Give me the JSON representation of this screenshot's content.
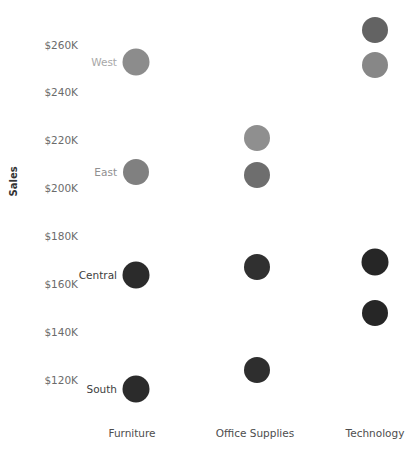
{
  "chart_data": {
    "type": "scatter",
    "title": "",
    "xlabel": "",
    "ylabel": "Sales",
    "categories": [
      "Furniture",
      "Office Supplies",
      "Technology"
    ],
    "y_ticks": [
      "$120K",
      "$140K",
      "$160K",
      "$180K",
      "$200K",
      "$220K",
      "$240K",
      "$260K"
    ],
    "y_tick_values": [
      120000,
      140000,
      160000,
      180000,
      200000,
      220000,
      240000,
      260000
    ],
    "ylim": [
      110000,
      272000
    ],
    "grid": false,
    "legend": "none",
    "series": [
      {
        "name": "West",
        "label": "West",
        "label_color": "#a8a8a8",
        "points": [
          {
            "category": "Furniture",
            "value": 252000,
            "color": "#8c8c8c",
            "size": 27
          },
          {
            "category": "Office Supplies",
            "value": 220000,
            "color": "#8f8f8f",
            "size": 26
          },
          {
            "category": "Technology",
            "value": 260500,
            "color": "#636363",
            "size": 26
          }
        ]
      },
      {
        "name": "East",
        "label": "East",
        "label_color": "#909090",
        "points": [
          {
            "category": "Furniture",
            "value": 206500,
            "color": "#808080",
            "size": 26
          },
          {
            "category": "Office Supplies",
            "value": 205500,
            "color": "#6e6e6e",
            "size": 26
          },
          {
            "category": "Technology",
            "value": 246000,
            "color": "#878787",
            "size": 26
          }
        ]
      },
      {
        "name": "Central",
        "label": "Central",
        "label_color": "#3d3d3d",
        "points": [
          {
            "category": "Furniture",
            "value": 163000,
            "color": "#2b2b2b",
            "size": 27
          },
          {
            "category": "Office Supplies",
            "value": 166500,
            "color": "#303030",
            "size": 26
          },
          {
            "category": "Technology",
            "value": 168000,
            "color": "#262626",
            "size": 27
          }
        ]
      },
      {
        "name": "South",
        "label": "South",
        "label_color": "#3d3d3d",
        "points": [
          {
            "category": "Furniture",
            "value": 115500,
            "color": "#2b2b2b",
            "size": 27
          },
          {
            "category": "Office Supplies",
            "value": 123500,
            "color": "#2e2e2e",
            "size": 26
          },
          {
            "category": "Technology",
            "value": 146500,
            "color": "#262626",
            "size": 26
          }
        ]
      }
    ],
    "row_labels": [
      {
        "text": "West",
        "category": "Furniture",
        "value": 252000,
        "color": "#a8a8a8"
      },
      {
        "text": "East",
        "category": "Furniture",
        "value": 206500,
        "color": "#909090"
      },
      {
        "text": "Central",
        "category": "Furniture",
        "value": 163000,
        "color": "#3d3d3d"
      },
      {
        "text": "South",
        "category": "Furniture",
        "value": 115500,
        "color": "#3d3d3d"
      }
    ]
  },
  "axis": {
    "y_title": "Sales",
    "y_ticks": [
      {
        "label": "$260K",
        "y": 45
      },
      {
        "label": "$240K",
        "y": 92
      },
      {
        "label": "$220K",
        "y": 140
      },
      {
        "label": "$200K",
        "y": 188
      },
      {
        "label": "$180K",
        "y": 236
      },
      {
        "label": "$160K",
        "y": 284
      },
      {
        "label": "$140K",
        "y": 332
      },
      {
        "label": "$120K",
        "y": 380
      }
    ],
    "x_ticks": [
      {
        "label": "Furniture",
        "x": 132
      },
      {
        "label": "Office Supplies",
        "x": 255
      },
      {
        "label": "Technology",
        "x": 375
      }
    ]
  },
  "marks": [
    {
      "name": "west-technology",
      "x": 375,
      "y": 30,
      "d": 26,
      "color": "#636363"
    },
    {
      "name": "east-technology",
      "x": 375,
      "y": 65,
      "d": 26,
      "color": "#878787"
    },
    {
      "name": "west-furniture",
      "x": 136,
      "y": 62,
      "d": 27,
      "color": "#8c8c8c"
    },
    {
      "name": "west-office-supplies",
      "x": 257,
      "y": 138,
      "d": 26,
      "color": "#8f8f8f"
    },
    {
      "name": "east-office-supplies",
      "x": 257,
      "y": 175,
      "d": 26,
      "color": "#6e6e6e"
    },
    {
      "name": "east-furniture",
      "x": 136,
      "y": 172,
      "d": 26,
      "color": "#808080"
    },
    {
      "name": "central-technology",
      "x": 375,
      "y": 262,
      "d": 27,
      "color": "#262626"
    },
    {
      "name": "central-office-supplies",
      "x": 257,
      "y": 267,
      "d": 26,
      "color": "#303030"
    },
    {
      "name": "central-furniture",
      "x": 136,
      "y": 275,
      "d": 27,
      "color": "#2b2b2b"
    },
    {
      "name": "south-technology",
      "x": 375,
      "y": 313,
      "d": 26,
      "color": "#262626"
    },
    {
      "name": "south-office-supplies",
      "x": 257,
      "y": 370,
      "d": 26,
      "color": "#2e2e2e"
    },
    {
      "name": "south-furniture",
      "x": 136,
      "y": 389,
      "d": 27,
      "color": "#2b2b2b"
    }
  ],
  "point_labels": [
    {
      "name": "west",
      "text": "West",
      "x": 123,
      "y": 62,
      "color": "#a8a8a8"
    },
    {
      "name": "east",
      "text": "East",
      "x": 123,
      "y": 172,
      "color": "#909090"
    },
    {
      "name": "central",
      "text": "Central",
      "x": 123,
      "y": 275,
      "color": "#3d3d3d"
    },
    {
      "name": "south",
      "text": "South",
      "x": 123,
      "y": 389,
      "color": "#3d3d3d"
    }
  ]
}
